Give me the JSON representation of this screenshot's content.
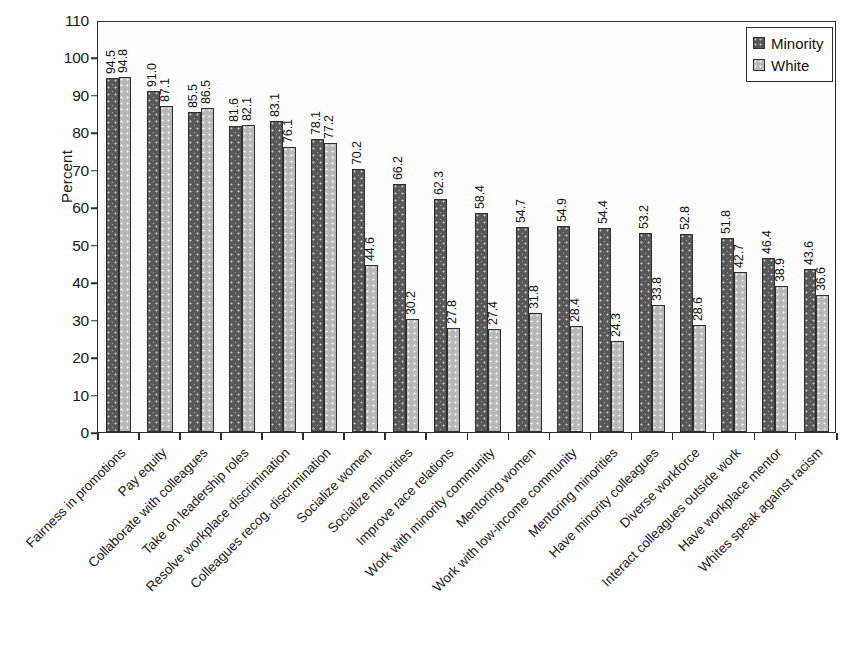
{
  "chart_data": {
    "type": "bar",
    "title": "",
    "subtitle": "",
    "xlabel": "",
    "ylabel": "Percent",
    "ylim": [
      0,
      110
    ],
    "ytick_step": 10,
    "yticks": [
      0,
      10,
      20,
      30,
      40,
      50,
      60,
      70,
      80,
      90,
      100,
      110
    ],
    "grid": false,
    "legend_position": "top-right",
    "orientation": "vertical",
    "value_labels_rotated": true,
    "categories": [
      "Fairness in promotions",
      "Pay equity",
      "Collaborate with colleagues",
      "Take on leadership roles",
      "Resolve workplace discrimination",
      "Colleagues recog. discrimination",
      "Socialize women",
      "Socialize minorities",
      "Improve race relations",
      "Work with minority community",
      "Mentoring women",
      "Work with low-income community",
      "Mentoring minorities",
      "Have minority colleagues",
      "Diverse workforce",
      "Interact colleagues outside work",
      "Have workplace mentor",
      "Whites speak against racism"
    ],
    "series": [
      {
        "name": "Minority",
        "color": "#595959",
        "values": [
          94.5,
          91.0,
          85.5,
          81.6,
          83.1,
          78.1,
          70.2,
          66.2,
          62.3,
          58.4,
          54.7,
          54.9,
          54.4,
          53.2,
          52.8,
          51.8,
          46.4,
          43.6
        ],
        "labels": [
          "94.5",
          "91.0",
          "85.5",
          "81.6",
          "83.1",
          "78.1",
          "70.2",
          "66.2",
          "62.3",
          "58.4",
          "54.7",
          "54.9",
          "54.4",
          "53.2",
          "52.8",
          "51.8",
          "46.4",
          "43.6"
        ]
      },
      {
        "name": "White",
        "color": "#b9b9b9",
        "values": [
          94.8,
          87.1,
          86.5,
          82.1,
          76.1,
          77.2,
          44.6,
          30.2,
          27.8,
          27.4,
          31.8,
          28.4,
          24.3,
          33.8,
          28.6,
          42.7,
          38.9,
          36.6
        ],
        "labels": [
          "94.8",
          "87.1",
          "86.5",
          "82.1",
          "76.1",
          "77.2",
          "44.6",
          "30.2",
          "27.8",
          "27.4",
          "31.8",
          "28.4",
          "24.3",
          "33.8",
          "28.6",
          "42.7",
          "38.9",
          "36.6"
        ]
      }
    ]
  },
  "legend": {
    "entries": [
      {
        "label": "Minority"
      },
      {
        "label": "White"
      }
    ]
  },
  "axis": {
    "y_title": "Percent"
  }
}
